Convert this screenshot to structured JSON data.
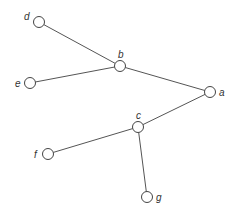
{
  "diagram": {
    "type": "tree",
    "nodes": [
      {
        "id": "a",
        "label": "a",
        "x": 210,
        "y": 92,
        "label_dx": 9,
        "label_dy": 4
      },
      {
        "id": "b",
        "label": "b",
        "x": 120,
        "y": 66,
        "label_dx": -2,
        "label_dy": -8
      },
      {
        "id": "c",
        "label": "c",
        "x": 138,
        "y": 127,
        "label_dx": -2,
        "label_dy": -8
      },
      {
        "id": "d",
        "label": "d",
        "x": 39,
        "y": 22,
        "label_dx": -15,
        "label_dy": -2
      },
      {
        "id": "e",
        "label": "e",
        "x": 30,
        "y": 83,
        "label_dx": -15,
        "label_dy": 4
      },
      {
        "id": "f",
        "label": "f",
        "x": 48,
        "y": 154,
        "label_dx": -14,
        "label_dy": 4
      },
      {
        "id": "g",
        "label": "g",
        "x": 147,
        "y": 197,
        "label_dx": 9,
        "label_dy": 4
      }
    ],
    "edges": [
      {
        "from": "a",
        "to": "b"
      },
      {
        "from": "a",
        "to": "c"
      },
      {
        "from": "b",
        "to": "d"
      },
      {
        "from": "b",
        "to": "e"
      },
      {
        "from": "c",
        "to": "f"
      },
      {
        "from": "c",
        "to": "g"
      }
    ]
  }
}
